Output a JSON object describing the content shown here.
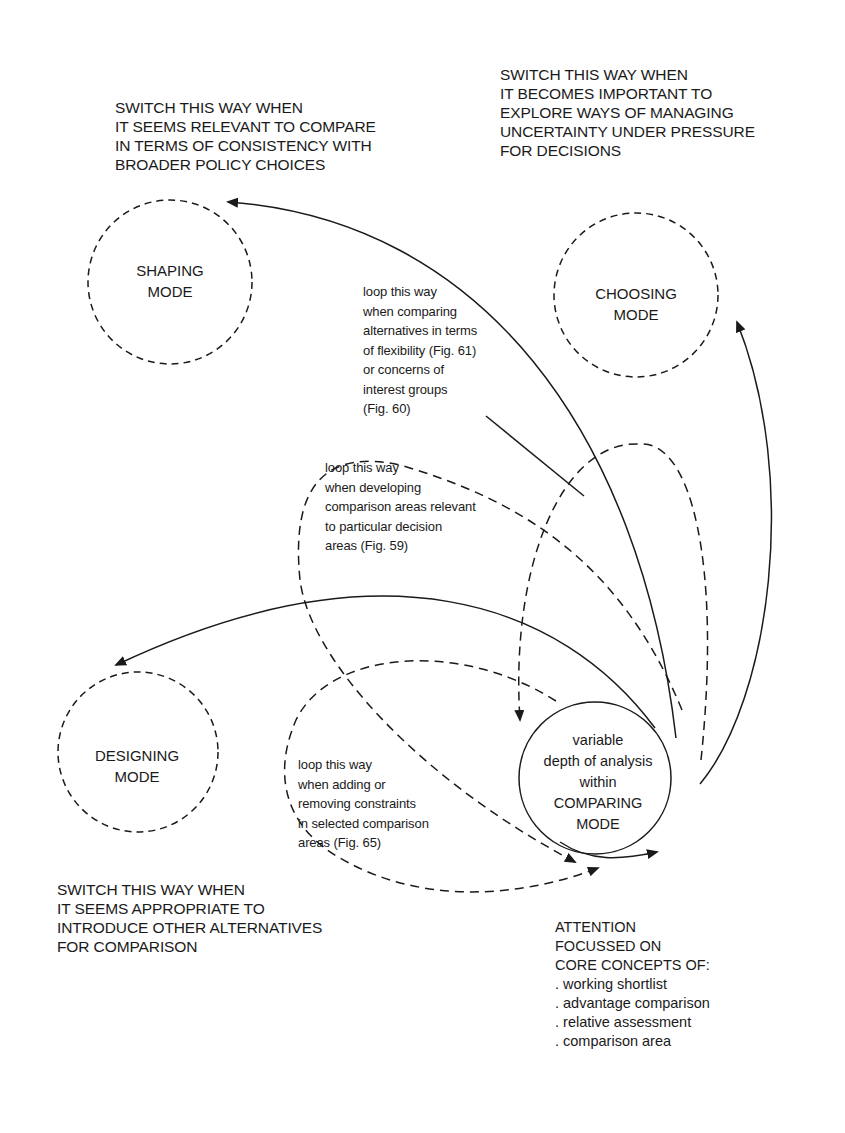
{
  "diagram": {
    "colors": {
      "ink": "#1a1a1a",
      "background": "#ffffff"
    },
    "switch_labels": {
      "shaping": [
        "SWITCH THIS WAY WHEN",
        "IT SEEMS RELEVANT TO COMPARE",
        "IN TERMS OF CONSISTENCY WITH",
        "BROADER POLICY CHOICES"
      ],
      "choosing": [
        "SWITCH THIS WAY WHEN",
        "IT BECOMES IMPORTANT TO",
        "EXPLORE WAYS OF MANAGING",
        "UNCERTAINTY UNDER PRESSURE",
        "FOR DECISIONS"
      ],
      "designing": [
        "SWITCH THIS WAY WHEN",
        "IT SEEMS APPROPRIATE TO",
        "INTRODUCE OTHER ALTERNATIVES",
        "FOR COMPARISON"
      ]
    },
    "modes": {
      "shaping": [
        "SHAPING",
        "MODE"
      ],
      "choosing": [
        "CHOOSING",
        "MODE"
      ],
      "designing": [
        "DESIGNING",
        "MODE"
      ],
      "comparing": [
        "variable",
        "depth of analysis",
        "within",
        "COMPARING",
        "MODE"
      ]
    },
    "loop_labels": {
      "flexibility": [
        "loop this way",
        "when comparing",
        "alternatives in terms",
        "of flexibility (Fig. 61)",
        "or concerns of",
        "interest groups",
        "(Fig. 60)"
      ],
      "comparison_areas": [
        "loop this way",
        "when developing",
        "comparison areas relevant",
        "to particular decision",
        "areas (Fig. 59)"
      ],
      "constraints": [
        "loop this way",
        "when adding or",
        "removing constraints",
        "in selected comparison",
        "areas (Fig. 65)"
      ]
    },
    "core_concepts": {
      "heading": [
        "ATTENTION",
        "FOCUSSED ON",
        "CORE CONCEPTS OF:"
      ],
      "items": [
        ". working shortlist",
        ". advantage comparison",
        ". relative assessment",
        ". comparison area"
      ]
    }
  }
}
